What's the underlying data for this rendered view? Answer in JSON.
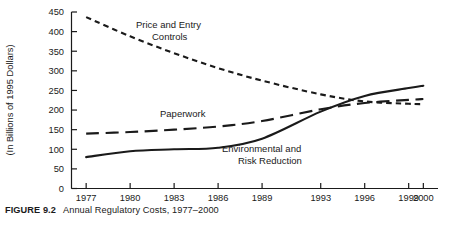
{
  "figure": {
    "caption_label": "FIGURE 9.2",
    "caption_text": "Annual Regulatory Costs, 1977–2000"
  },
  "chart_data": {
    "type": "line",
    "title": "Annual Regulatory Costs, 1977–2000",
    "xlabel": "",
    "ylabel": "(In Billions of 1995 Dollars)",
    "categories": [
      "1977",
      "1980",
      "1983",
      "1986",
      "1989",
      "1993",
      "1996",
      "1999",
      "2000"
    ],
    "x_positions": [
      1977,
      1980,
      1983,
      1986,
      1989,
      1993,
      1996,
      1999,
      2000
    ],
    "xlim": [
      1976,
      2001
    ],
    "ylim": [
      0,
      450
    ],
    "y_ticks": [
      0,
      50,
      100,
      150,
      200,
      250,
      300,
      350,
      400,
      450
    ],
    "grid": false,
    "legend": "inline-annotations",
    "series": [
      {
        "name": "Price and Entry Controls",
        "style": "short-dash",
        "color": "#1a1a1a",
        "label_lines": [
          "Price and Entry",
          "Controls"
        ],
        "values": [
          437,
          388,
          345,
          307,
          275,
          240,
          222,
          216,
          215
        ]
      },
      {
        "name": "Paperwork",
        "style": "long-dash",
        "color": "#1a1a1a",
        "label_lines": [
          "Paperwork"
        ],
        "values": [
          140,
          144,
          150,
          158,
          172,
          202,
          218,
          226,
          228
        ]
      },
      {
        "name": "Environmental and Risk Reduction",
        "style": "solid",
        "color": "#1a1a1a",
        "label_lines": [
          "Environmental and",
          "Risk Reduction"
        ],
        "values": [
          80,
          95,
          100,
          104,
          127,
          196,
          236,
          256,
          262
        ]
      }
    ]
  },
  "axis": {
    "y_tick_labels": [
      "0",
      "50",
      "100",
      "150",
      "200",
      "250",
      "300",
      "350",
      "400",
      "450"
    ],
    "x_tick_labels": [
      "1977",
      "1980",
      "1983",
      "1986",
      "1989",
      "1993",
      "1996",
      "1999",
      "2000"
    ],
    "y_axis_title": "(In Billions of 1995 Dollars)"
  },
  "annotations": {
    "price_entry_line1": "Price and Entry",
    "price_entry_line2": "Controls",
    "paperwork": "Paperwork",
    "environmental_line1": "Environmental and",
    "environmental_line2": "Risk Reduction"
  }
}
